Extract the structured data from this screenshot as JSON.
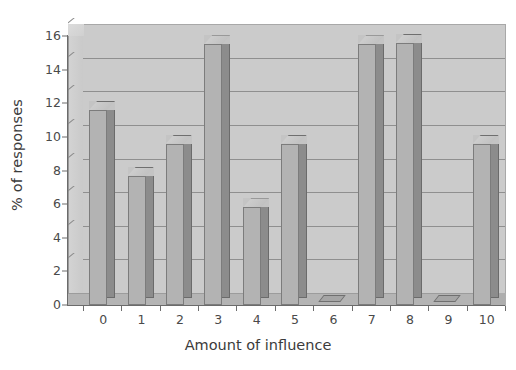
{
  "chart_data": {
    "type": "bar",
    "title": "",
    "subtitle": "",
    "xlabel": "Amount of influence",
    "ylabel": "% of responses",
    "categories": [
      "0",
      "1",
      "2",
      "3",
      "4",
      "5",
      "6",
      "7",
      "8",
      "9",
      "10"
    ],
    "values": [
      11.6,
      7.7,
      9.6,
      15.5,
      5.8,
      9.6,
      0.0,
      15.5,
      15.6,
      0.0,
      9.6
    ],
    "series": [
      {
        "name": "% of responses",
        "values": [
          11.6,
          7.7,
          9.6,
          15.5,
          5.8,
          9.6,
          0.0,
          15.5,
          15.6,
          0.0,
          9.6
        ]
      }
    ],
    "ylim": [
      0,
      16
    ],
    "xlim": [
      0,
      10
    ],
    "ytick_labels": [
      "0",
      "2",
      "4",
      "6",
      "8",
      "10",
      "12",
      "14",
      "16"
    ],
    "ytick_values": [
      0,
      2,
      4,
      6,
      8,
      10,
      12,
      14,
      16
    ],
    "xtick_labels": [
      "0",
      "1",
      "2",
      "3",
      "4",
      "5",
      "6",
      "7",
      "8",
      "9",
      "10"
    ],
    "grid": "horizontal",
    "legend": "none",
    "style": "3d-column",
    "colors": {
      "bar_face": "#b3b3b3",
      "bar_side": "#8c8c8c",
      "bar_top": "#c4c4c4",
      "plot_back": "#cbcbcb",
      "plot_floor": "#b4b4b4",
      "gridline": "#8f8f8f",
      "axis": "#6b6b6b",
      "text": "#3b3b3b",
      "background": "#ffffff"
    }
  }
}
